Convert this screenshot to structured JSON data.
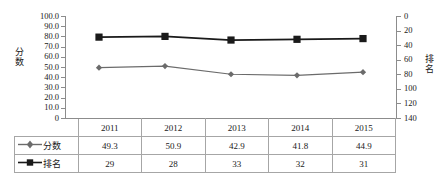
{
  "chart_data": {
    "type": "line",
    "title": "",
    "categories": [
      "2011",
      "2012",
      "2013",
      "2014",
      "2015"
    ],
    "series": [
      {
        "name": "分数",
        "values": [
          49.3,
          50.9,
          42.9,
          41.8,
          44.9
        ],
        "axis": "left",
        "marker": "diamond",
        "color": "#6b6b6b"
      },
      {
        "name": "排名",
        "values": [
          29,
          28,
          33,
          32,
          31
        ],
        "axis": "right",
        "marker": "square",
        "color": "#1a1a1a"
      }
    ],
    "xlabel": "",
    "ylabel": "分数",
    "ylabel_right": "排名",
    "ylim": [
      0,
      100
    ],
    "ylim_right": [
      0,
      140
    ],
    "y_right_inverted": true,
    "yticks": [
      "100.0",
      "90.0",
      "80.0",
      "70.0",
      "60.0",
      "50.0",
      "40.0",
      "30.0",
      "20.0",
      "10.0",
      "0"
    ],
    "yticks_right": [
      "0",
      "20",
      "40",
      "60",
      "80",
      "100",
      "120",
      "140"
    ],
    "grid": false,
    "legend_position": "table-left"
  },
  "table": {
    "header_label": "",
    "years": [
      "2011",
      "2012",
      "2013",
      "2014",
      "2015"
    ],
    "rows": [
      {
        "label": "分数",
        "marker": "diamond-icon",
        "values": [
          "49.3",
          "50.9",
          "42.9",
          "41.8",
          "44.9"
        ]
      },
      {
        "label": "排名",
        "marker": "square-icon",
        "values": [
          "29",
          "28",
          "33",
          "32",
          "31"
        ]
      }
    ]
  },
  "caption": {
    "text": ""
  },
  "colors": {
    "score_series": "#6b6b6b",
    "rank_series": "#1a1a1a",
    "axis": "#8c8c8c",
    "table_border": "#a6a6a6",
    "background": "#ffffff"
  }
}
